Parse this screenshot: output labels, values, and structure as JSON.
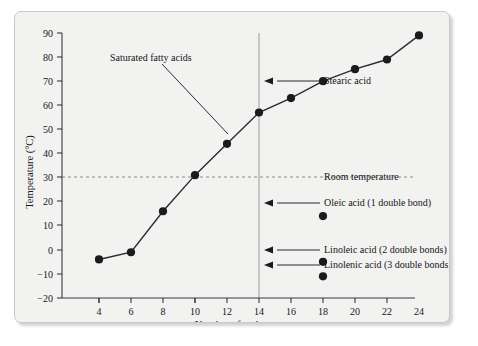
{
  "chart_data": {
    "type": "line",
    "title": "",
    "xlabel": "Number of carbon atoms",
    "ylabel": "Temperature (°C)",
    "xlim": [
      3,
      25
    ],
    "ylim": [
      -20,
      90
    ],
    "xticks": [
      4,
      6,
      8,
      10,
      12,
      14,
      16,
      18,
      20,
      22,
      24
    ],
    "yticks": [
      -20,
      -10,
      0,
      10,
      20,
      30,
      40,
      50,
      60,
      70,
      80,
      90
    ],
    "grid": false,
    "legend": "none",
    "series": [
      {
        "name": "Saturated fatty acids",
        "marker": "filled-circle",
        "x": [
          4,
          6,
          8,
          10,
          12,
          14,
          16,
          18,
          20,
          22,
          24
        ],
        "values": [
          -4,
          -1,
          16,
          31,
          44,
          57,
          63,
          70,
          75,
          79,
          89
        ]
      },
      {
        "name": "Unsaturated fatty acids (C18)",
        "marker": "filled-circle",
        "line": false,
        "x": [
          18,
          18,
          18
        ],
        "values": [
          14,
          -5,
          -11
        ]
      }
    ],
    "reference_lines": [
      {
        "name": "Room temperature",
        "orientation": "horizontal",
        "value": 25,
        "style": "dashed",
        "color": "#8a8a8a"
      },
      {
        "name": "C18 marker",
        "orientation": "vertical",
        "value": 18,
        "style": "solid",
        "color": "#9a9a9a"
      }
    ],
    "annotations": [
      {
        "name": "saturated-fatty-acids",
        "label": "Saturated fatty acids",
        "points_to_x": 13,
        "points_to_y": 50
      },
      {
        "name": "stearic-acid",
        "label": "Stearic acid",
        "points_to_x": 18,
        "points_to_y": 70
      },
      {
        "name": "oleic-acid",
        "label": "Oleic acid (1 double bond)",
        "points_to_x": 18,
        "points_to_y": 14
      },
      {
        "name": "linoleic-acid",
        "label": "Linoleic acid (2 double bonds)",
        "points_to_x": 18,
        "points_to_y": -5
      },
      {
        "name": "linolenic-acid",
        "label": "Linolenic acid (3 double bonds)",
        "points_to_x": 18,
        "points_to_y": -11
      },
      {
        "name": "room-temperature",
        "label": "Room temperature",
        "points_to_x": 25,
        "points_to_y": 25
      }
    ],
    "tick_labels": {
      "x": [
        "4",
        "6",
        "8",
        "10",
        "12",
        "14",
        "16",
        "18",
        "20",
        "22",
        "24"
      ],
      "y": [
        "−20",
        "−10",
        "0",
        "10",
        "20",
        "30",
        "40",
        "50",
        "60",
        "70",
        "80",
        "90"
      ]
    },
    "colors": {
      "marker": "#1a1a1f",
      "line": "#2a2a30",
      "axis": "#3a3a40",
      "reference_dashed": "#8a8a8a",
      "reference_solid": "#9a9a9a",
      "background": "#f2f2f0"
    }
  }
}
